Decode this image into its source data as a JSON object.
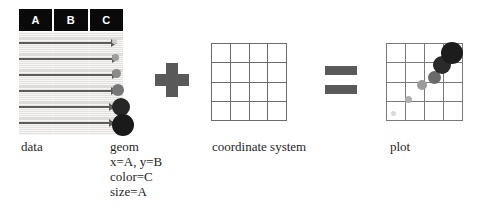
{
  "figure": {
    "background": "#ffffff"
  },
  "colors": {
    "header_bg": "#0a0a0a",
    "header_text": "#ffffff",
    "table_bg": "#eceae8",
    "row_stripe": "#dedcda",
    "arrow": "#5c5c5c",
    "operator": "#595959",
    "grid_line": "#6b6b6b",
    "plot_grid_line": "#7a7a7a",
    "caption_text": "#1f1f1f"
  },
  "data_panel": {
    "label": "data",
    "columns": [
      "A",
      "B",
      "C"
    ],
    "row_count": 6
  },
  "arrows": {
    "count": 6,
    "rows": [
      {
        "top": 6,
        "length": 92
      },
      {
        "top": 22,
        "length": 93
      },
      {
        "top": 38,
        "length": 93
      },
      {
        "top": 54,
        "length": 92
      },
      {
        "top": 70,
        "length": 90
      },
      {
        "top": 86,
        "length": 90
      }
    ]
  },
  "geom": {
    "label": "geom",
    "spec_lines": [
      "x=A, y=B",
      "color=C",
      "size=A"
    ],
    "dots": [
      {
        "cx": 6,
        "cy": 9,
        "r": 2.5,
        "color": "#cfcfcf"
      },
      {
        "cx": 7,
        "cy": 25,
        "r": 3.5,
        "color": "#9e9e9e"
      },
      {
        "cx": 8,
        "cy": 41,
        "r": 4.5,
        "color": "#8a8a8a"
      },
      {
        "cx": 10,
        "cy": 58,
        "r": 6.0,
        "color": "#767676"
      },
      {
        "cx": 13,
        "cy": 75,
        "r": 9.0,
        "color": "#262626"
      },
      {
        "cx": 15,
        "cy": 93,
        "r": 11.0,
        "color": "#1a1a1a"
      }
    ]
  },
  "operators": {
    "plus": "+",
    "equals": "="
  },
  "coordinate_system": {
    "label": "coordinate system",
    "rows": 4,
    "columns": 4
  },
  "plot": {
    "label": "plot",
    "rows": 4,
    "columns": 4,
    "points": [
      {
        "cx": 7,
        "cy": 70,
        "r": 2.5,
        "color": "#d8d8d8"
      },
      {
        "cx": 22,
        "cy": 56,
        "r": 3.5,
        "color": "#b0b0b0"
      },
      {
        "cx": 36,
        "cy": 42,
        "r": 5.0,
        "color": "#9a9a9a"
      },
      {
        "cx": 48,
        "cy": 34,
        "r": 6.5,
        "color": "#6a6a6a"
      },
      {
        "cx": 56,
        "cy": 22,
        "r": 9.0,
        "color": "#2a2a2a"
      },
      {
        "cx": 66,
        "cy": 10,
        "r": 11.0,
        "color": "#1c1c1c"
      }
    ]
  },
  "chart_data": {
    "type": "scatter",
    "title": "plot",
    "xlabel": "A",
    "ylabel": "B",
    "legend": [],
    "grid": true,
    "xlim": [
      0,
      4
    ],
    "ylim": [
      0,
      4
    ],
    "encodings": {
      "x": "A",
      "y": "B",
      "color": "C",
      "size": "A"
    },
    "series": [
      {
        "name": "observations",
        "x": [
          0.35,
          1.15,
          1.85,
          2.5,
          2.9,
          3.45
        ],
        "y": [
          0.4,
          1.1,
          1.8,
          2.25,
          2.85,
          3.45
        ],
        "size": [
          2.5,
          3.5,
          5.0,
          6.5,
          9.0,
          11.0
        ],
        "color": [
          "#d8d8d8",
          "#b0b0b0",
          "#9a9a9a",
          "#6a6a6a",
          "#2a2a2a",
          "#1c1c1c"
        ]
      }
    ]
  }
}
